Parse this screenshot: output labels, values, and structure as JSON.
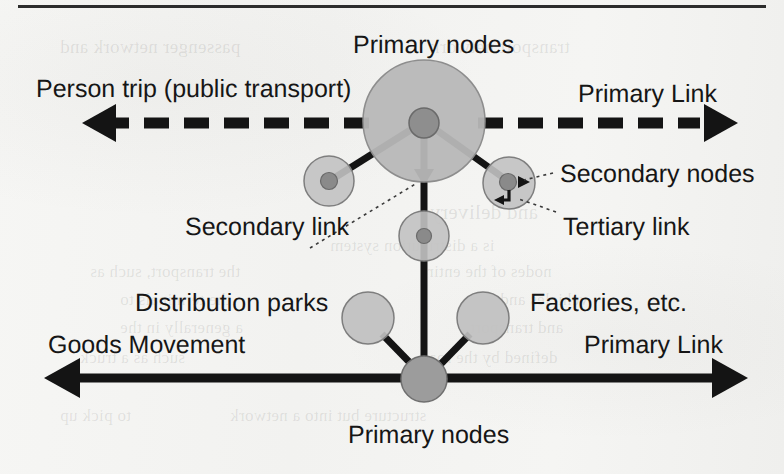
{
  "figure": {
    "kind": "hierarchical-network-diagram",
    "background_color": "#f3f3f1",
    "ink_color": "#161616",
    "node_fill": "#b9b9b9",
    "node_stroke": "#6f6f6f",
    "primary_node_fill": "#9a9a9a",
    "top_rule": true
  },
  "labels": {
    "person_trip": "Person trip (public transport)",
    "primary_nodes_top": "Primary nodes",
    "primary_link_top": "Primary Link",
    "secondary_nodes": "Secondary nodes",
    "secondary_link": "Secondary link",
    "tertiary_link": "Tertiary link",
    "distribution_parks": "Distribution parks",
    "factories": "Factories, etc.",
    "goods_movement": "Goods Movement",
    "primary_link_bottom": "Primary Link",
    "primary_nodes_bottom": "Primary nodes"
  },
  "ghost_text": [
    {
      "text": "passenger network and",
      "x": 60,
      "y": 36,
      "size": 19
    },
    {
      "text": "transport network",
      "x": 430,
      "y": 36,
      "size": 19
    },
    {
      "text": "and delivery",
      "x": 430,
      "y": 200,
      "size": 21
    },
    {
      "text": "is a distribution system",
      "x": 330,
      "y": 236,
      "size": 17
    },
    {
      "text": "the transport, such as",
      "x": 90,
      "y": 262,
      "size": 17
    },
    {
      "text": "nodes of the entire",
      "x": 420,
      "y": 262,
      "size": 17
    },
    {
      "text": "the terminals to",
      "x": 120,
      "y": 290,
      "size": 17
    },
    {
      "text": "vehicles and",
      "x": 500,
      "y": 290,
      "size": 17
    },
    {
      "text": "a generally in the",
      "x": 120,
      "y": 318,
      "size": 17
    },
    {
      "text": "and transport",
      "x": 470,
      "y": 318,
      "size": 17
    },
    {
      "text": "such as a truck",
      "x": 80,
      "y": 348,
      "size": 17
    },
    {
      "text": "defined by the road",
      "x": 420,
      "y": 348,
      "size": 17
    },
    {
      "text": "structure but into a network",
      "x": 230,
      "y": 406,
      "size": 17
    },
    {
      "text": "to pick up",
      "x": 60,
      "y": 406,
      "size": 17
    }
  ],
  "nodes": [
    {
      "id": "top-primary",
      "role": "primary",
      "cx": 424,
      "cy": 121,
      "r_halo": 61,
      "r_core": 15
    },
    {
      "id": "top-secondary-left",
      "role": "secondary",
      "cx": 329,
      "cy": 181,
      "r_halo": 25,
      "r_core": 8
    },
    {
      "id": "top-secondary-right",
      "role": "secondary",
      "cx": 509,
      "cy": 183,
      "r_halo": 26,
      "r_core": 8
    },
    {
      "id": "top-secondary-center",
      "role": "secondary",
      "cx": 424,
      "cy": 236,
      "r_halo": 25,
      "r_core": 7
    },
    {
      "id": "bottom-primary",
      "role": "primary",
      "cx": 424,
      "cy": 379,
      "r_halo": 0,
      "r_core": 23
    },
    {
      "id": "distribution-park",
      "role": "facility",
      "cx": 368,
      "cy": 318,
      "r_halo": 26,
      "r_core": 0
    },
    {
      "id": "factory",
      "role": "facility",
      "cx": 483,
      "cy": 318,
      "r_halo": 26,
      "r_core": 0
    }
  ],
  "links": {
    "primary_dashed_axis_y": 123,
    "primary_solid_axis_y": 378,
    "secondary_links": [
      {
        "from": "top-primary",
        "to": "top-secondary-left"
      },
      {
        "from": "top-primary",
        "to": "top-secondary-right"
      },
      {
        "from": "top-primary",
        "to": "bottom-primary"
      }
    ],
    "facility_links": [
      {
        "from": "bottom-primary",
        "to": "distribution-park"
      },
      {
        "from": "bottom-primary",
        "to": "factory"
      }
    ]
  }
}
